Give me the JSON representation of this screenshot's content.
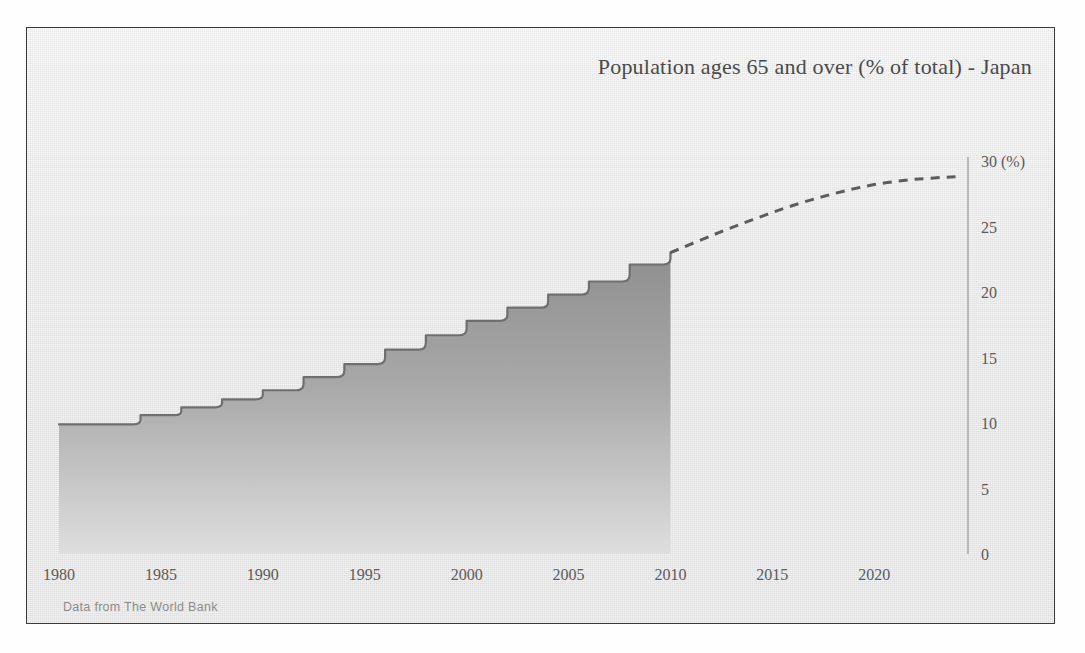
{
  "chart_title": "Population ages 65 and over (% of total) - Japan",
  "source_note": "Data from The World Bank",
  "colors": {
    "frame_background": "#ebebeb",
    "frame_border": "#3a3a3a",
    "title_text": "#4a4a4a",
    "tick_text": "#5a5a5a",
    "area_fill_top": "#8a8a8a",
    "area_fill_bottom": "#d8d8d8",
    "area_line": "#6f6f6f",
    "forecast_line": "#5c5c5c",
    "x_axis_line": "#6b6b6b",
    "y_axis_line": "#9a9a9a",
    "source_text": "#8d8d8d"
  },
  "chart_data": {
    "type": "area",
    "title": "Population ages 65 and over (% of total) - Japan",
    "subtitle": "",
    "xlabel": "",
    "ylabel": "(%)",
    "y_unit_label": "(%)",
    "xlim": [
      1980,
      2024.5
    ],
    "ylim": [
      0,
      30
    ],
    "grid": false,
    "legend": false,
    "y_axis_position": "right",
    "yticks": [
      0,
      5,
      10,
      15,
      20,
      25,
      30
    ],
    "ytick_labels": [
      "0",
      "5",
      "10",
      "15",
      "20",
      "25",
      "30 (%)"
    ],
    "xticks": [
      1980,
      1985,
      1990,
      1995,
      2000,
      2005,
      2010,
      2015,
      2020
    ],
    "xtick_labels": [
      "1980",
      "1985",
      "1990",
      "1995",
      "2000",
      "2005",
      "2010",
      "2015",
      "2020"
    ],
    "step_style": "post",
    "series": [
      {
        "name": "Historical (actual)",
        "style": "stepped-area",
        "x": [
          1980,
          1982,
          1984,
          1986,
          1988,
          1990,
          1992,
          1994,
          1996,
          1998,
          2000,
          2002,
          2004,
          2006,
          2008,
          2010
        ],
        "values": [
          9.9,
          9.9,
          10.6,
          11.2,
          11.8,
          12.5,
          13.5,
          14.5,
          15.6,
          16.7,
          17.8,
          18.8,
          19.8,
          20.8,
          22.1,
          23.0
        ]
      },
      {
        "name": "Projection (forecast)",
        "style": "dashed-line",
        "x": [
          2010,
          2012,
          2014,
          2016,
          2018,
          2020,
          2022,
          2024
        ],
        "values": [
          23.0,
          24.3,
          25.5,
          26.6,
          27.5,
          28.2,
          28.6,
          28.8
        ]
      }
    ],
    "annotations": [
      {
        "text": "Data from The World Bank",
        "position": "bottom-left"
      }
    ]
  }
}
